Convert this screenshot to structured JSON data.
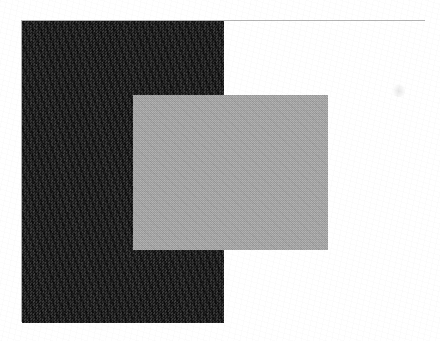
{
  "figure": {
    "kind": "simultaneous-brightness-contrast-demo",
    "caption": "",
    "canvas": {
      "width": 440,
      "height": 341,
      "background": "#ffffff"
    },
    "frame": {
      "name": "plate-border",
      "x": 21,
      "y": 20,
      "width": 404,
      "height": 302,
      "border_color": "#b4b4b4",
      "border_width": 1,
      "fill": "#ffffff"
    },
    "regions": [
      {
        "name": "dark-surround",
        "label": "dark background half",
        "x": 21,
        "y": 21,
        "width": 202,
        "height": 301,
        "color": "#141414",
        "texture": "mottled scan noise"
      },
      {
        "name": "light-surround",
        "label": "light background half",
        "x": 223,
        "y": 21,
        "width": 202,
        "height": 301,
        "color": "#ffffff",
        "texture": "plain paper"
      }
    ],
    "test_patch": {
      "name": "gray-test-square",
      "label": "uniform gray test patch",
      "x": 132,
      "y": 94,
      "width": 195,
      "height": 155,
      "color": "#a6a6a6",
      "texture": "halftone dither",
      "spans": "dark-surround and light-surround"
    },
    "artifacts": [
      {
        "name": "scan-smudge",
        "label": "faint scanner smudge",
        "x": 392,
        "y": 83,
        "width": 12,
        "height": 13,
        "color": "rgba(0,0,0,0.08)"
      }
    ]
  },
  "chart_data": {
    "type": "heatmap",
    "title": "",
    "xlabel": "",
    "ylabel": "",
    "description": "Simultaneous contrast figure: a single uniform gray rectangle overlapping a black field on the left and a white field on the right.",
    "legend": [],
    "grid": false,
    "xlim": [
      0,
      440
    ],
    "ylim": [
      0,
      341
    ],
    "elements": [
      {
        "id": "dark-surround",
        "shape": "rect",
        "x": 21,
        "y": 21,
        "w": 202,
        "h": 301,
        "gray_level": 20,
        "hex": "#141414"
      },
      {
        "id": "light-surround",
        "shape": "rect",
        "x": 223,
        "y": 21,
        "w": 202,
        "h": 301,
        "gray_level": 255,
        "hex": "#ffffff"
      },
      {
        "id": "gray-test-square",
        "shape": "rect",
        "x": 132,
        "y": 94,
        "w": 195,
        "h": 155,
        "gray_level": 166,
        "hex": "#a6a6a6"
      },
      {
        "id": "plate-border",
        "shape": "rect",
        "x": 21,
        "y": 20,
        "w": 404,
        "h": 302,
        "gray_level": 180,
        "hex": "#b4b4b4"
      }
    ]
  }
}
